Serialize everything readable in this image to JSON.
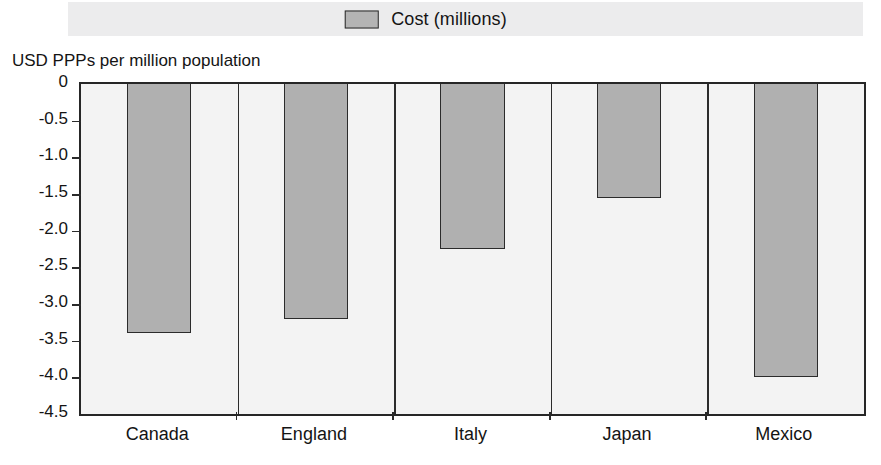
{
  "legend": {
    "entries": [
      {
        "label": "Cost (millions)",
        "color": "#b4b4b4",
        "swatch_name": "legend-swatch-cost"
      }
    ]
  },
  "axis_title": "USD PPPs per million population",
  "chart_data": {
    "type": "bar",
    "title": "",
    "subtitle": "",
    "xlabel": "",
    "ylabel": "USD PPPs per million population",
    "categories": [
      "Canada",
      "England",
      "Italy",
      "Japan",
      "Mexico"
    ],
    "series": [
      {
        "name": "Cost (millions)",
        "color": "#b0b0b0",
        "values": [
          -3.4,
          -3.2,
          -2.25,
          -1.55,
          -4.0
        ]
      }
    ],
    "ylim": [
      -4.5,
      0
    ],
    "yticks": [
      0,
      -0.5,
      -1.0,
      -1.5,
      -2.0,
      -2.5,
      -3.0,
      -3.5,
      -4.0,
      -4.5
    ],
    "ytick_labels": [
      "0",
      "-0.5",
      "-1.0",
      "-1.5",
      "-2.0",
      "-2.5",
      "-3.0",
      "-3.5",
      "-4.0",
      "-4.5"
    ],
    "grid": false,
    "legend_position": "top-center",
    "bar_orientation": "vertical",
    "baseline": 0
  }
}
